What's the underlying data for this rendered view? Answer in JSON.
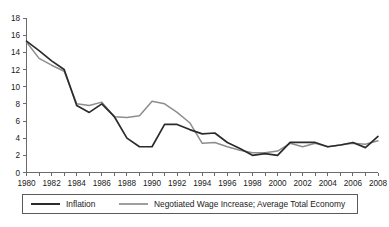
{
  "chart_data": {
    "type": "line",
    "title": "",
    "subtitle": "",
    "xlabel": "",
    "ylabel": "",
    "xlim": [
      1980,
      2008
    ],
    "ylim": [
      0,
      18
    ],
    "y_ticks": [
      0,
      2,
      4,
      6,
      8,
      10,
      12,
      14,
      16,
      18
    ],
    "y_tick_labels": [
      "0",
      "2",
      "4",
      "6",
      "8",
      "10",
      "12",
      "14",
      "16",
      "18"
    ],
    "x": [
      1980,
      1981,
      1982,
      1983,
      1984,
      1985,
      1986,
      1987,
      1988,
      1989,
      1990,
      1991,
      1992,
      1993,
      1994,
      1995,
      1996,
      1997,
      1998,
      1999,
      2000,
      2001,
      2002,
      2003,
      2004,
      2005,
      2006,
      2007,
      2008
    ],
    "x_tick_labels": [
      "1980",
      "1982",
      "1984",
      "1986",
      "1988",
      "1990",
      "1992",
      "1994",
      "1996",
      "1998",
      "2000",
      "2002",
      "2004",
      "2006",
      "2008"
    ],
    "x_minor_ticks_every": 1,
    "x_labels_every": 2,
    "grid": false,
    "legend_position": "bottom",
    "series": [
      {
        "name": "Inflation",
        "color": "#2b2b2b",
        "values": [
          15.3,
          14.2,
          13.0,
          12.0,
          7.8,
          7.0,
          8.0,
          6.5,
          4.0,
          3.0,
          3.0,
          5.6,
          5.6,
          5.0,
          4.5,
          4.6,
          3.5,
          2.8,
          2.0,
          2.2,
          2.0,
          3.5,
          3.5,
          3.5,
          3.0,
          3.2,
          3.5,
          2.9,
          4.2
        ]
      },
      {
        "name": "Negotiated Wage Increase; Average Total Economy",
        "color": "#8d8d8d",
        "values": [
          15.2,
          13.3,
          12.5,
          11.8,
          8.0,
          7.8,
          8.2,
          6.5,
          6.4,
          6.6,
          8.3,
          8.0,
          7.0,
          5.8,
          3.4,
          3.5,
          3.0,
          2.6,
          2.3,
          2.3,
          2.5,
          3.4,
          3.0,
          3.4,
          3.0,
          3.2,
          3.4,
          3.3,
          3.7
        ]
      }
    ]
  },
  "legend": {
    "items": [
      {
        "label": "Inflation",
        "swatch": "line-swatch-dark"
      },
      {
        "label": "Negotiated Wage Increase; Average Total Economy",
        "swatch": "line-swatch-gray"
      }
    ]
  },
  "colors": {
    "inflation": "#2b2b2b",
    "wage": "#8d8d8d",
    "axis": "#6b6b6b",
    "text": "#1a1a1a",
    "background": "#ffffff"
  }
}
